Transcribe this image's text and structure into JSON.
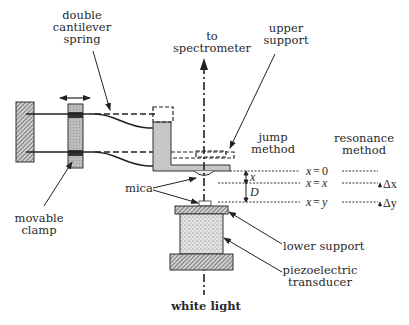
{
  "figure": {
    "labels": {
      "double_cantilever_spring": [
        "double",
        "cantilever",
        "spring"
      ],
      "to_spectrometer": [
        "to",
        "spectrometer"
      ],
      "upper_support": [
        "upper",
        "support"
      ],
      "jump_method": [
        "jump",
        "method"
      ],
      "resonance_method": [
        "resonance",
        "method"
      ],
      "mica": "mica",
      "movable_clamp": [
        "movable",
        "clamp"
      ],
      "lower_support": "lower support",
      "piezoelectric_transducer": [
        "piezoelectric",
        "transducer"
      ],
      "white_light": "white light"
    },
    "positions": {
      "jump": [
        {
          "lhs": "x",
          "eq": "=",
          "rhs": "0"
        },
        {
          "lhs": "x",
          "eq": "=",
          "rhs": "x"
        },
        {
          "lhs": "x",
          "eq": "=",
          "rhs": "y"
        }
      ],
      "resonance": [
        {
          "label": ""
        },
        {
          "label": "Δx"
        },
        {
          "label": "Δy"
        }
      ]
    },
    "dimensions": {
      "gap_small": "x",
      "gap_large": "D"
    },
    "colors": {
      "ink": "#2a2a2a",
      "gray_fill": "#c8c8c8",
      "hatch": "#555555"
    }
  }
}
